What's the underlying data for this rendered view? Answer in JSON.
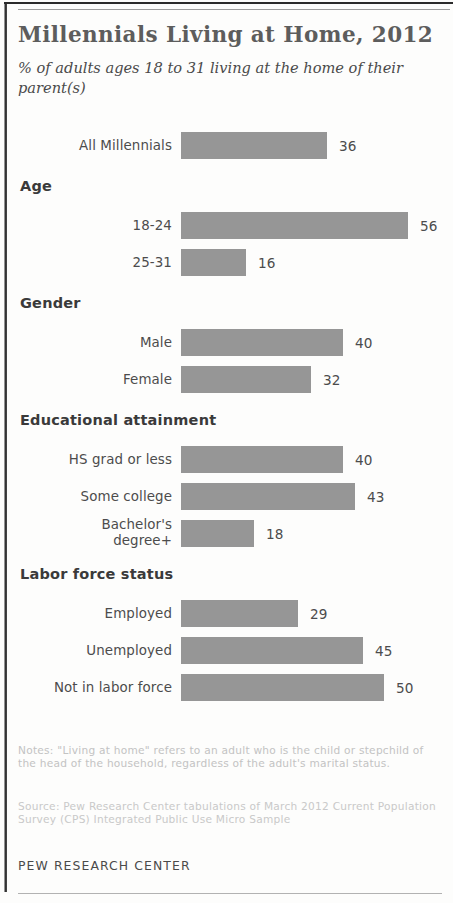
{
  "header": {
    "title": "Millennials Living at Home, 2012",
    "subtitle": "% of adults ages 18 to 31 living at the home of their parent(s)"
  },
  "footer": {
    "notes": "Notes: \"Living at home\" refers to an adult who is the child or stepchild of the head of the household, regardless of the adult's marital status.",
    "source": "Source: Pew Research Center tabulations of March 2012 Current Population Survey (CPS) Integrated Public Use Micro Sample",
    "attribution": "PEW RESEARCH CENTER"
  },
  "style": {
    "bar_color": "#969696",
    "title_color": "#5d5d5d",
    "text_color": "#4c4c4c",
    "footnote_color": "#c3c3c3"
  },
  "chart_data": {
    "type": "bar",
    "orientation": "horizontal",
    "title": "Millennials Living at Home, 2012",
    "subtitle": "% of adults ages 18 to 31 living at the home of their parent(s)",
    "xlabel": "",
    "ylabel": "",
    "xlim": [
      0,
      60
    ],
    "grid": false,
    "legend": "none",
    "value_suffix": "",
    "groups": [
      {
        "header": "",
        "rows": [
          {
            "label": "All Millennials",
            "value": 36
          }
        ]
      },
      {
        "header": "Age",
        "rows": [
          {
            "label": "18-24",
            "value": 56
          },
          {
            "label": "25-31",
            "value": 16
          }
        ]
      },
      {
        "header": "Gender",
        "rows": [
          {
            "label": "Male",
            "value": 40
          },
          {
            "label": "Female",
            "value": 32
          }
        ]
      },
      {
        "header": "Educational attainment",
        "rows": [
          {
            "label": "HS grad or less",
            "value": 40
          },
          {
            "label": "Some college",
            "value": 43
          },
          {
            "label": "Bachelor's degree+",
            "value": 18
          }
        ]
      },
      {
        "header": "Labor force status",
        "rows": [
          {
            "label": "Employed",
            "value": 29
          },
          {
            "label": "Unemployed",
            "value": 45
          },
          {
            "label": "Not in labor force",
            "value": 50
          }
        ]
      }
    ],
    "categories": [
      "All Millennials",
      "18-24",
      "25-31",
      "Male",
      "Female",
      "HS grad or less",
      "Some college",
      "Bachelor's degree+",
      "Employed",
      "Unemployed",
      "Not in labor force"
    ],
    "values": [
      36,
      56,
      16,
      40,
      32,
      40,
      43,
      18,
      29,
      45,
      50
    ]
  }
}
